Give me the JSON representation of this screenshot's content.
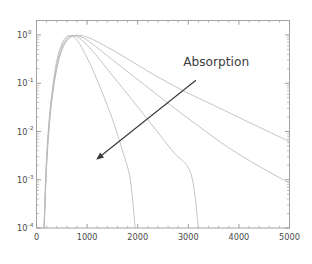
{
  "figure": {
    "background_color": "#ffffff",
    "frame_color": "#9a9a9a",
    "curve_color": "#b9b9b9",
    "arrow_color": "#3a3a3a",
    "annotation_color": "#3c3c3c"
  },
  "chart_data": {
    "type": "line",
    "title": "",
    "xlabel": "",
    "ylabel": "",
    "yscale": "log",
    "xscale": "linear",
    "xlim": [
      0,
      5000
    ],
    "ylim": [
      0.0001,
      2.0
    ],
    "grid": false,
    "legend": null,
    "xticks": [
      0,
      1000,
      2000,
      3000,
      4000,
      5000
    ],
    "xticklabels": [
      "0",
      "1000",
      "2000",
      "3000",
      "4000",
      "5000"
    ],
    "yticks": [
      1,
      0.1,
      0.01,
      0.001,
      0.0001
    ],
    "yticklabels": [
      {
        "base": "10",
        "exponent": "0"
      },
      {
        "base": "10",
        "exponent": "-1"
      },
      {
        "base": "10",
        "exponent": "-2"
      },
      {
        "base": "10",
        "exponent": "-3"
      },
      {
        "base": "10",
        "exponent": "-4"
      }
    ],
    "annotations": [
      {
        "text": "Absorption",
        "x": 2900,
        "y": 0.28,
        "arrow_from": {
          "x": 3150,
          "y": 0.115
        },
        "arrow_to": {
          "x": 1180,
          "y": 0.0026
        }
      }
    ],
    "series": [
      {
        "name": "curve-1-lowest-absorption",
        "x": [
          150,
          200,
          260,
          330,
          420,
          520,
          640,
          760,
          900,
          1100,
          1400,
          1800,
          2300,
          2900,
          3500,
          4200,
          5000
        ],
        "y": [
          0.0001,
          0.0022,
          0.018,
          0.08,
          0.26,
          0.55,
          0.84,
          0.97,
          0.97,
          0.82,
          0.56,
          0.32,
          0.155,
          0.07,
          0.035,
          0.0155,
          0.0062
        ]
      },
      {
        "name": "curve-2",
        "x": [
          150,
          200,
          260,
          330,
          420,
          520,
          630,
          740,
          880,
          1050,
          1300,
          1700,
          2150,
          2650,
          3200,
          3800,
          4400,
          5000
        ],
        "y": [
          0.0001,
          0.002,
          0.016,
          0.072,
          0.25,
          0.56,
          0.86,
          0.97,
          0.92,
          0.72,
          0.45,
          0.21,
          0.09,
          0.035,
          0.013,
          0.0046,
          0.0019,
          0.00085
        ]
      },
      {
        "name": "curve-3",
        "x": [
          150,
          195,
          250,
          320,
          405,
          500,
          610,
          720,
          850,
          1000,
          1200,
          1500,
          1900,
          2300,
          2700,
          3050,
          3200
        ],
        "y": [
          0.0001,
          0.0019,
          0.015,
          0.068,
          0.25,
          0.57,
          0.88,
          0.97,
          0.86,
          0.62,
          0.36,
          0.145,
          0.044,
          0.013,
          0.0038,
          0.00135,
          0.0001
        ]
      },
      {
        "name": "curve-4-highest-absorption",
        "x": [
          150,
          190,
          245,
          310,
          390,
          480,
          580,
          690,
          800,
          930,
          1080,
          1280,
          1500,
          1700,
          1850,
          1950
        ],
        "y": [
          0.0001,
          0.0018,
          0.015,
          0.07,
          0.26,
          0.58,
          0.9,
          0.96,
          0.78,
          0.47,
          0.225,
          0.072,
          0.018,
          0.004,
          0.00105,
          0.0001
        ]
      }
    ]
  }
}
